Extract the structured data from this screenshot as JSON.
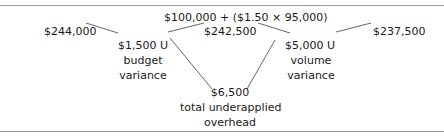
{
  "diagram": {
    "formula": "$100,000 + ($1.50 × 95,000)",
    "actual": "$244,000",
    "budget_allowed": "$242,500",
    "applied": "$237,500",
    "budget_variance": {
      "value": "$1,500 U",
      "label_line1": "budget",
      "label_line2": "variance"
    },
    "volume_variance": {
      "value": "$5,000 U",
      "label_line1": "volume",
      "label_line2": "variance"
    },
    "total": {
      "value": "$6,500",
      "label_line1": "total underapplied",
      "label_line2": "overhead"
    }
  }
}
